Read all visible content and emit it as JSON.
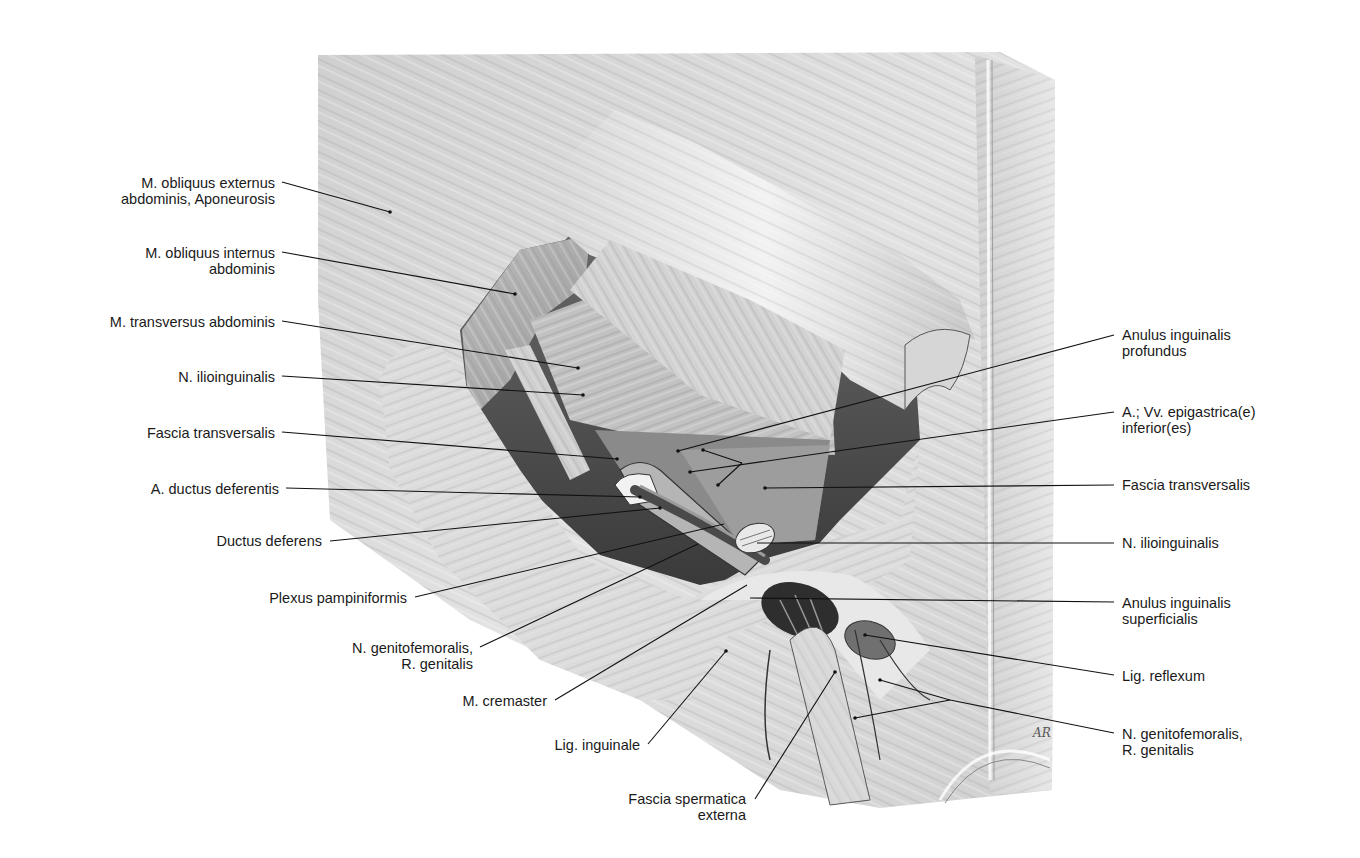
{
  "figure": {
    "signature": "AR"
  },
  "labels_left": [
    {
      "id": "obl-ext",
      "lines": [
        "M. obliquus externus",
        "abdominis, Aponeurosis"
      ],
      "x": 275,
      "y": 175
    },
    {
      "id": "obl-int",
      "lines": [
        "M. obliquus internus",
        "abdominis"
      ],
      "x": 275,
      "y": 245
    },
    {
      "id": "transv",
      "lines": [
        "M. transversus abdominis"
      ],
      "x": 275,
      "y": 314
    },
    {
      "id": "ilioing-l",
      "lines": [
        "N. ilioinguinalis"
      ],
      "x": 275,
      "y": 369
    },
    {
      "id": "fascia-l",
      "lines": [
        "Fascia transversalis"
      ],
      "x": 275,
      "y": 425
    },
    {
      "id": "a-ductus",
      "lines": [
        "A. ductus deferentis"
      ],
      "x": 279,
      "y": 481
    },
    {
      "id": "ductus",
      "lines": [
        "Ductus deferens"
      ],
      "x": 322,
      "y": 533
    },
    {
      "id": "plexus",
      "lines": [
        "Plexus pampiniformis"
      ],
      "x": 407,
      "y": 590
    },
    {
      "id": "genitofem-l",
      "lines": [
        "N. genitofemoralis,",
        "R. genitalis"
      ],
      "x": 473,
      "y": 640
    },
    {
      "id": "cremaster",
      "lines": [
        "M. cremaster"
      ],
      "x": 547,
      "y": 693
    },
    {
      "id": "lig-ing",
      "lines": [
        "Lig. inguinale"
      ],
      "x": 640,
      "y": 737
    },
    {
      "id": "fascia-sperm",
      "lines": [
        "Fascia spermatica",
        "externa"
      ],
      "x": 746,
      "y": 791
    }
  ],
  "labels_right": [
    {
      "id": "anulus-prof",
      "lines": [
        "Anulus inguinalis",
        "profundus"
      ],
      "x": 1122,
      "y": 327
    },
    {
      "id": "epigastrica",
      "lines": [
        "A.; Vv. epigastrica(e)",
        "inferior(es)"
      ],
      "x": 1122,
      "y": 404
    },
    {
      "id": "fascia-r",
      "lines": [
        "Fascia transversalis"
      ],
      "x": 1122,
      "y": 477
    },
    {
      "id": "ilioing-r",
      "lines": [
        "N. ilioinguinalis"
      ],
      "x": 1122,
      "y": 535
    },
    {
      "id": "anulus-sup",
      "lines": [
        "Anulus inguinalis",
        "superficialis"
      ],
      "x": 1122,
      "y": 595
    },
    {
      "id": "lig-reflex",
      "lines": [
        "Lig. reflexum"
      ],
      "x": 1122,
      "y": 668
    },
    {
      "id": "genitofem-r",
      "lines": [
        "N. genitofemoralis,",
        "R. genitalis"
      ],
      "x": 1122,
      "y": 726
    }
  ],
  "colors": {
    "background": "#ffffff",
    "text": "#1a1a1a",
    "leader": "#111111",
    "tissue_light": "#e6e6e6",
    "tissue_mid": "#bdbdbd",
    "tissue_dark": "#5a5a5a",
    "cavity": "#3a3a3a"
  }
}
